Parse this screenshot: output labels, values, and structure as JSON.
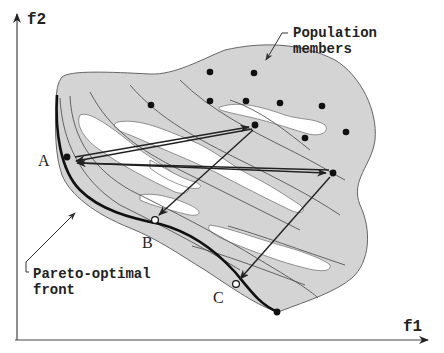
{
  "axes": {
    "x_label": "f1",
    "y_label": "f2"
  },
  "annotations": {
    "population_line1": "Population",
    "population_line2": "members",
    "pareto_line1": "Pareto-optimal",
    "pareto_line2": "front"
  },
  "points": {
    "A": "A",
    "B": "B",
    "C": "C"
  },
  "colors": {
    "region_fill": "#d4d4d4",
    "hole_fill": "#ffffff",
    "outline": "#555555",
    "front": "#111111",
    "dot": "#111111"
  }
}
